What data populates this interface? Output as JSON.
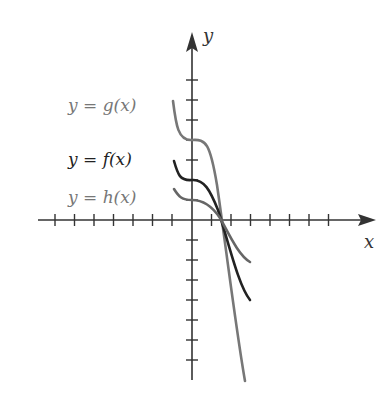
{
  "diagram": {
    "type": "function-graph",
    "axes": {
      "x_label": "x",
      "y_label": "y",
      "x_ticks_negative": 7,
      "x_ticks_positive": 7,
      "y_ticks_positive": 7,
      "y_ticks_negative": 7
    },
    "curves": [
      {
        "name": "g",
        "label": "y = g(x)",
        "color": "#777777"
      },
      {
        "name": "f",
        "label": "y = f(x)",
        "color": "#222222"
      },
      {
        "name": "h",
        "label": "y = h(x)",
        "color": "#666666"
      }
    ],
    "colors": {
      "axis": "#333333",
      "label_gray": "#777777",
      "label_dark": "#222222"
    }
  }
}
